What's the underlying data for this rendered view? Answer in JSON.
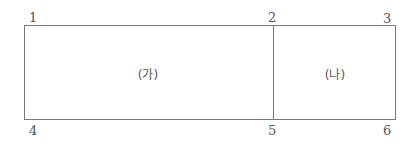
{
  "diagram": {
    "points": [
      {
        "id": "1",
        "label": "1"
      },
      {
        "id": "2",
        "label": "2"
      },
      {
        "id": "3",
        "label": "3"
      },
      {
        "id": "4",
        "label": "4"
      },
      {
        "id": "5",
        "label": "5"
      },
      {
        "id": "6",
        "label": "6"
      }
    ],
    "regions": [
      {
        "id": "ga",
        "label": "(가)"
      },
      {
        "id": "na",
        "label": "(나)"
      }
    ]
  }
}
